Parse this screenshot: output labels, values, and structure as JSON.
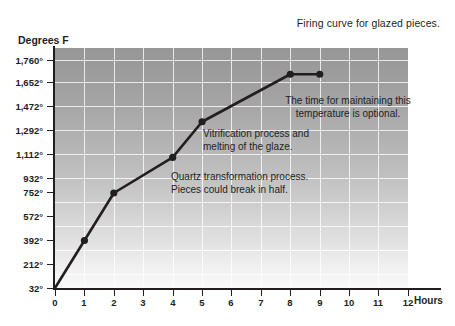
{
  "chart_data": {
    "type": "line",
    "title": "Firing curve for glazed pieces.",
    "xlabel": "Hours",
    "ylabel": "Degrees F",
    "xlim": [
      0,
      12
    ],
    "ylim": [
      32,
      1832
    ],
    "grid": true,
    "legend": "none",
    "x_ticks": [
      "0",
      "1",
      "2",
      "3",
      "4",
      "5",
      "6",
      "7",
      "8",
      "9",
      "10",
      "11",
      "12"
    ],
    "x_tick_values": [
      0,
      1,
      2,
      3,
      4,
      5,
      6,
      7,
      8,
      9,
      10,
      11,
      12
    ],
    "y_ticks": [
      "32°",
      "212°",
      "392°",
      "572°",
      "752°",
      "932°",
      "1,112°",
      "1,292°",
      "1,472°",
      "1,652°",
      "1,760°"
    ],
    "y_tick_values": [
      32,
      212,
      392,
      572,
      752,
      932,
      1112,
      1292,
      1472,
      1652,
      1760
    ],
    "series": [
      {
        "name": "Firing curve",
        "color": "#231f20",
        "x": [
          0,
          1,
          2,
          4,
          5,
          8,
          9
        ],
        "y": [
          32,
          392,
          752,
          1022,
          1292,
          1652,
          1652
        ],
        "markers": [
          false,
          true,
          true,
          true,
          true,
          true,
          true
        ]
      }
    ],
    "annotations": [
      {
        "id": "hold",
        "text": "The time for maintaining this\ntemperature is optional."
      },
      {
        "id": "vitrification",
        "text": "Vitrification process and\nmelting of the glaze."
      },
      {
        "id": "quartz",
        "text": "Quartz transformation process.\nPieces could break in half."
      }
    ]
  },
  "colors": {
    "ink": "#231f20",
    "plot_top": "#979797",
    "plot_bottom": "#fafafa",
    "gridline": "#ffffff",
    "page_background": "#ffffff"
  }
}
